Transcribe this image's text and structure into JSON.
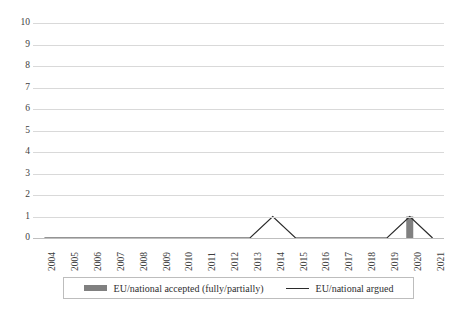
{
  "chart_data": {
    "type": "bar",
    "title": "",
    "subtitle": "",
    "xlabel": "",
    "ylabel": "",
    "categories": [
      "2004",
      "2005",
      "2006",
      "2007",
      "2008",
      "2009",
      "2010",
      "2011",
      "2012",
      "2013",
      "2014",
      "2015",
      "2016",
      "2017",
      "2018",
      "2019",
      "2020",
      "2021"
    ],
    "ylim": [
      0,
      10
    ],
    "ytick_labels": [
      "10",
      "9",
      "8",
      "7",
      "6",
      "5",
      "4",
      "3",
      "2",
      "1",
      "0"
    ],
    "ytick_values": [
      10,
      9,
      8,
      7,
      6,
      5,
      4,
      3,
      2,
      1,
      0
    ],
    "grid": true,
    "legend_position": "bottom",
    "series": [
      {
        "name": "EU/national accepted (fully/partially)",
        "type": "bar",
        "color": "#808080",
        "values": [
          0,
          0,
          0,
          0,
          0,
          0,
          0,
          0,
          0,
          0,
          0,
          0,
          0,
          0,
          0,
          0,
          1,
          0
        ]
      },
      {
        "name": "EU/national argued",
        "type": "line",
        "color": "#2b2b2b",
        "values": [
          0,
          0,
          0,
          0,
          0,
          0,
          0,
          0,
          0,
          0,
          1,
          0,
          0,
          0,
          0,
          0,
          1,
          0
        ]
      }
    ]
  },
  "legend": {
    "entries": [
      {
        "label": "EU/national accepted (fully/partially)",
        "marker": "bar-swatch"
      },
      {
        "label": "EU/national argued",
        "marker": "line-swatch"
      }
    ]
  }
}
